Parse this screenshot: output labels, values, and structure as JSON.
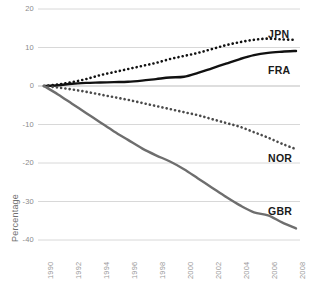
{
  "chart_data": {
    "type": "line",
    "title": "",
    "subtitle": "",
    "xlabel": "",
    "ylabel": "Percentage",
    "xlim": [
      1990,
      2008
    ],
    "ylim": [
      -40,
      20
    ],
    "grid": true,
    "legend_position": "inline-right-of-series-end",
    "x": [
      1990,
      1991,
      1992,
      1993,
      1994,
      1995,
      1996,
      1997,
      1998,
      1999,
      2000,
      2001,
      2002,
      2003,
      2004,
      2005,
      2006,
      2007,
      2008
    ],
    "x_tick_labels": [
      "1990",
      "1992",
      "1994",
      "1996",
      "1998",
      "2000",
      "2002",
      "2004",
      "2006",
      "2008"
    ],
    "y_tick_labels": [
      "20",
      "10",
      "0",
      "-10",
      "-20",
      "-30",
      "-40"
    ],
    "y_ticks": [
      20,
      10,
      0,
      -10,
      -20,
      -30,
      -40
    ],
    "series": [
      {
        "name": "JPN",
        "style": "dotted",
        "color": "#111111",
        "values": [
          0,
          0.4,
          1.0,
          1.8,
          2.8,
          3.6,
          4.4,
          5.2,
          6.0,
          7.0,
          7.8,
          8.6,
          9.6,
          10.6,
          11.4,
          12.0,
          12.3,
          12.1,
          12.0
        ]
      },
      {
        "name": "FRA",
        "style": "solid",
        "color": "#111111",
        "values": [
          0,
          0.2,
          0.6,
          0.8,
          0.9,
          1.0,
          1.1,
          1.4,
          1.8,
          2.2,
          2.4,
          3.4,
          4.6,
          5.8,
          7.0,
          8.0,
          8.6,
          8.9,
          9.1
        ]
      },
      {
        "name": "NOR",
        "style": "dotted",
        "color": "#4a4a4a",
        "values": [
          0,
          -0.4,
          -0.9,
          -1.5,
          -2.2,
          -2.9,
          -3.6,
          -4.4,
          -5.2,
          -6.0,
          -6.8,
          -7.6,
          -8.6,
          -9.6,
          -10.6,
          -12.0,
          -13.4,
          -15.0,
          -16.4
        ]
      },
      {
        "name": "GBR",
        "style": "solid",
        "color": "#6e6e6e",
        "values": [
          0,
          -2.2,
          -4.6,
          -7.0,
          -9.4,
          -11.8,
          -14.0,
          -16.2,
          -18.0,
          -19.6,
          -21.6,
          -24.0,
          -26.4,
          -28.8,
          -31.0,
          -32.8,
          -33.6,
          -35.4,
          -37.0
        ]
      }
    ]
  },
  "labels": {
    "jpn": "JPN",
    "fra": "FRA",
    "nor": "NOR",
    "gbr": "GBR"
  },
  "colors": {
    "grid": "#d8d8d8",
    "zero_line": "#bdbdbd",
    "tick_text": "#9a9a9a",
    "axis_title": "#6f6f6f",
    "jpn": "#111111",
    "fra": "#111111",
    "nor": "#4a4a4a",
    "gbr": "#6e6e6e"
  }
}
